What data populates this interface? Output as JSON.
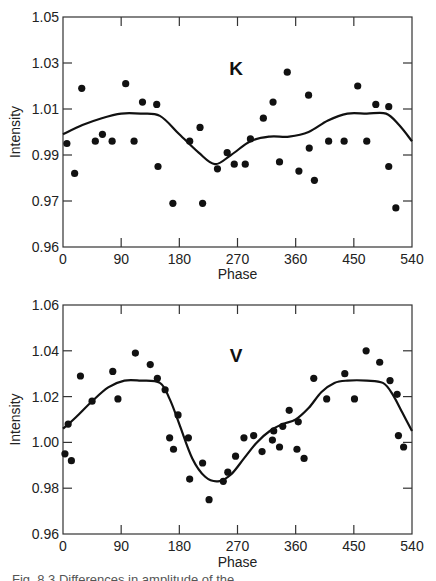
{
  "chart_data": [
    {
      "type": "scatter",
      "panel_label": "K",
      "title": "",
      "xlabel": "Phase",
      "ylabel": "Intensity",
      "xlim": [
        0,
        540
      ],
      "ylim": [
        0.95,
        1.05
      ],
      "xticks": [
        0,
        90,
        180,
        270,
        360,
        450,
        540
      ],
      "yticks": [
        {
          "value": 1.05,
          "label": "1.05"
        },
        {
          "value": 1.03,
          "label": "1.03"
        },
        {
          "value": 1.01,
          "label": "1.01"
        },
        {
          "value": 0.99,
          "label": "0.99"
        },
        {
          "value": 0.97,
          "label": "0.97"
        },
        {
          "value": 0.95,
          "label": "0.96"
        }
      ],
      "grid": false,
      "series": [
        {
          "name": "observations",
          "style": "points",
          "x": [
            6,
            18,
            29,
            50,
            61,
            76,
            97,
            110,
            123,
            145,
            147,
            170,
            196,
            212,
            216,
            239,
            254,
            265,
            282,
            290,
            310,
            325,
            335,
            347,
            365,
            380,
            381,
            389,
            411,
            435,
            456,
            470,
            484,
            504,
            504,
            515
          ],
          "y": [
            0.995,
            0.982,
            1.019,
            0.996,
            0.999,
            0.996,
            1.021,
            0.996,
            1.013,
            1.012,
            0.985,
            0.969,
            0.996,
            1.002,
            0.969,
            0.984,
            0.991,
            0.986,
            0.986,
            0.997,
            1.006,
            1.013,
            0.987,
            1.026,
            0.983,
            1.016,
            0.993,
            0.979,
            0.996,
            0.996,
            1.02,
            0.996,
            1.012,
            1.011,
            0.985,
            0.967
          ]
        },
        {
          "name": "model",
          "style": "line",
          "x": [
            0,
            30,
            60,
            90,
            120,
            150,
            180,
            210,
            235,
            260,
            290,
            320,
            350,
            380,
            410,
            440,
            470,
            500,
            520,
            540
          ],
          "y": [
            0.999,
            1.003,
            1.006,
            1.008,
            1.008,
            1.007,
            0.999,
            0.991,
            0.986,
            0.99,
            0.996,
            0.998,
            0.998,
            1.0,
            1.005,
            1.008,
            1.008,
            1.008,
            1.003,
            0.996
          ]
        }
      ]
    },
    {
      "type": "scatter",
      "panel_label": "V",
      "title": "",
      "xlabel": "Phase",
      "ylabel": "Intensity",
      "xlim": [
        0,
        540
      ],
      "ylim": [
        0.96,
        1.06
      ],
      "xticks": [
        0,
        90,
        180,
        270,
        360,
        450,
        540
      ],
      "yticks": [
        {
          "value": 1.06,
          "label": "1.06"
        },
        {
          "value": 1.04,
          "label": "1.04"
        },
        {
          "value": 1.02,
          "label": "1.02"
        },
        {
          "value": 1.0,
          "label": "1.00"
        },
        {
          "value": 0.98,
          "label": "0.98"
        },
        {
          "value": 0.96,
          "label": "0.96"
        }
      ],
      "grid": false,
      "series": [
        {
          "name": "observations",
          "style": "points",
          "x": [
            3,
            8,
            13,
            27,
            45,
            77,
            85,
            112,
            135,
            146,
            158,
            165,
            171,
            178,
            194,
            196,
            216,
            226,
            248,
            255,
            267,
            280,
            295,
            308,
            324,
            326,
            335,
            340,
            350,
            362,
            364,
            373,
            388,
            408,
            436,
            451,
            469,
            490,
            506,
            517,
            519,
            527
          ],
          "y": [
            0.995,
            1.008,
            0.992,
            1.029,
            1.018,
            1.031,
            1.019,
            1.039,
            1.034,
            1.028,
            1.023,
            1.002,
            0.997,
            1.012,
            1.002,
            0.984,
            0.991,
            0.975,
            0.983,
            0.987,
            0.994,
            1.002,
            1.003,
            0.996,
            1.001,
            1.005,
            0.998,
            1.007,
            1.014,
            0.997,
            1.009,
            0.993,
            1.028,
            1.019,
            1.03,
            1.019,
            1.04,
            1.035,
            1.027,
            1.021,
            1.003,
            0.998
          ]
        },
        {
          "name": "model",
          "style": "line",
          "x": [
            0,
            20,
            45,
            70,
            95,
            120,
            150,
            165,
            180,
            200,
            220,
            240,
            260,
            280,
            300,
            320,
            340,
            360,
            380,
            400,
            420,
            440,
            470,
            495,
            510,
            525,
            540
          ],
          "y": [
            1.006,
            1.011,
            1.018,
            1.024,
            1.027,
            1.027,
            1.026,
            1.019,
            1.008,
            0.993,
            0.985,
            0.983,
            0.986,
            0.993,
            1.0,
            1.005,
            1.008,
            1.01,
            1.015,
            1.022,
            1.026,
            1.027,
            1.027,
            1.026,
            1.021,
            1.013,
            1.005
          ]
        }
      ]
    }
  ],
  "caption": "Fig. 8.3 Differences in amplitude of the ..."
}
